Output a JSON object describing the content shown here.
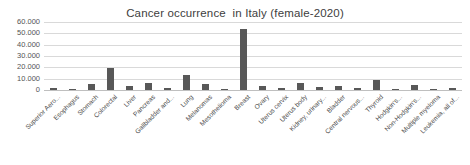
{
  "chart_data": {
    "type": "bar",
    "title": "Cancer occurrence  in Italy (female-2020)",
    "xlabel": "",
    "ylabel": "",
    "ylim": [
      0,
      60000
    ],
    "ytick_labels": [
      "0",
      "10.000",
      "20.000",
      "30.000",
      "40.000",
      "50.000",
      "60.000"
    ],
    "ytick_values": [
      0,
      10000,
      20000,
      30000,
      40000,
      50000,
      60000
    ],
    "grid": true,
    "legend": false,
    "bar_color": "#585858",
    "gridline_color": "#d9d9d9",
    "categories": [
      "Superior Aero...",
      "Esophagus",
      "Stomach",
      "Colorectal",
      "Liver",
      "Pancreas",
      "Gallbladder and...",
      "Lung",
      "Melanomas",
      "Mesothelioma",
      "Breast",
      "Ovary",
      "Uterus cervix",
      "Uterus body",
      "Kidney, urinary...",
      "Bladder",
      "Central nervous...",
      "Thyroid",
      "Hodgkin's...",
      "Non-Hodgkin's...",
      "Multiple myeloma",
      "Leukemia, all of..."
    ],
    "values": [
      2200,
      500,
      4900,
      19800,
      3600,
      6400,
      2100,
      13000,
      5400,
      400,
      54000,
      3900,
      1400,
      6600,
      3100,
      3600,
      1600,
      8800,
      400,
      4200,
      1300,
      2000
    ]
  }
}
